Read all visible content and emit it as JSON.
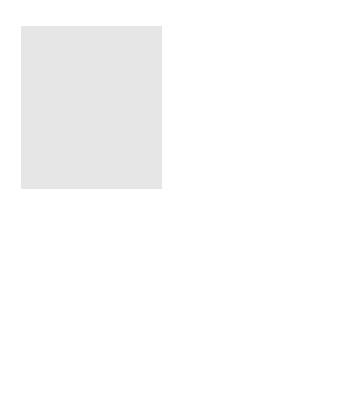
{
  "map": {
    "type": "air-mass-source-regions",
    "region": "North America",
    "colors": {
      "ocean": "#e4e4e4",
      "land": "#cfcfcf",
      "air_mass": "#7a7a7a",
      "border": "#222222"
    },
    "air_masses": [
      {
        "id": "cold-dry",
        "line1": "Cold-",
        "line2": "Dry"
      },
      {
        "id": "cool-wet-pacific",
        "line1": "Cool-",
        "line2": "Wet"
      },
      {
        "id": "cool-wet-atlantic",
        "line1": "Cool-",
        "line2": "Wet"
      },
      {
        "id": "hot-dry",
        "line1": "Hot-",
        "line2": "Dry"
      },
      {
        "id": "warm-wet-pacific",
        "line1": "Warm-",
        "line2": "Wet"
      },
      {
        "id": "warm-wet-atlantic",
        "line1": "Warm-",
        "line2": "Wet"
      }
    ],
    "scale": {
      "miles_label": "1000 miles",
      "km_label": "1000 km"
    }
  }
}
